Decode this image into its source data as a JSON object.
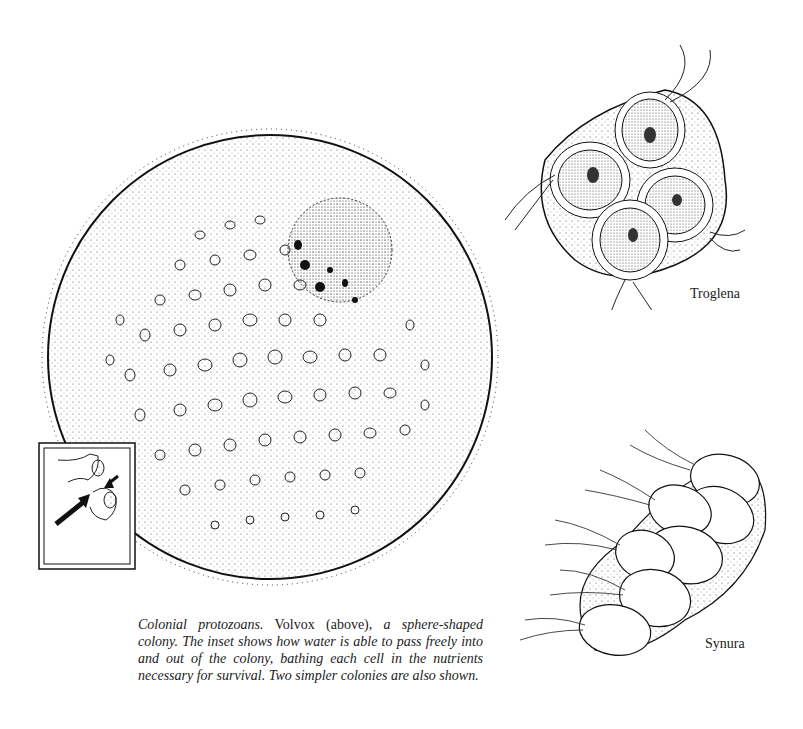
{
  "figure": {
    "volvox": {
      "name": "Volvox",
      "inset_description": "inset showing water passing in and out of colony between cells"
    },
    "troglena": {
      "label": "Troglena"
    },
    "synura": {
      "label": "Synura"
    }
  },
  "caption": {
    "title": "Colonial protozoans.",
    "text_1": " Volvox (above), ",
    "text_2": "a sphere-shaped colony. The inset shows how water is able to pass freely into and out of the colony, bathing each cell in the nutrients necessary for survival. Two simpler colonies are also shown."
  },
  "colors": {
    "ink": "#1a1a1a",
    "paper": "#ffffff"
  }
}
